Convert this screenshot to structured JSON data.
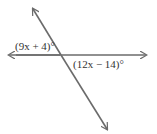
{
  "diagram": {
    "angle_labels": {
      "upper_left": "(9x + 4)°",
      "lower_right": "(12x − 14)°"
    },
    "colors": {
      "line": "#6b6b6b",
      "text": "#333333"
    }
  }
}
